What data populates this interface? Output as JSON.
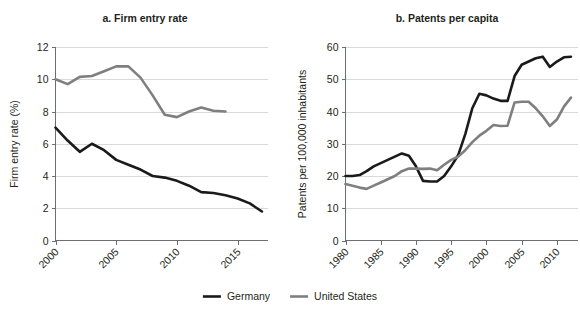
{
  "figure": {
    "width": 580,
    "height": 316,
    "background": "#ffffff"
  },
  "legend": {
    "position": "bottom-center",
    "entries": [
      {
        "label": "Germany",
        "color": "#1a1a1a",
        "width": 2.6
      },
      {
        "label": "United States",
        "color": "#7f7f7f",
        "width": 2.6
      }
    ]
  },
  "chart_data": [
    {
      "type": "line",
      "id": "panel-a",
      "title": "a. Firm entry rate",
      "xlabel": "",
      "ylabel": "Firm entry rate (%)",
      "xlim": [
        2000,
        2017.5
      ],
      "ylim": [
        0,
        12
      ],
      "yticks": [
        0,
        2,
        4,
        6,
        8,
        10,
        12
      ],
      "xticks": [
        2000,
        2005,
        2010,
        2015
      ],
      "grid": "horizontal",
      "legend_position": "figure-bottom",
      "series": [
        {
          "name": "Germany",
          "color": "#1a1a1a",
          "x": [
            2000,
            2001,
            2002,
            2003,
            2004,
            2005,
            2006,
            2007,
            2008,
            2009,
            2010,
            2011,
            2012,
            2013,
            2014,
            2015,
            2016,
            2017
          ],
          "values": [
            7.0,
            6.2,
            5.5,
            6.0,
            5.6,
            5.0,
            4.7,
            4.4,
            4.0,
            3.9,
            3.7,
            3.4,
            3.0,
            2.95,
            2.8,
            2.6,
            2.3,
            1.8
          ]
        },
        {
          "name": "United States",
          "color": "#7f7f7f",
          "x": [
            2000,
            2001,
            2002,
            2003,
            2004,
            2005,
            2006,
            2007,
            2008,
            2009,
            2010,
            2011,
            2012,
            2013,
            2014
          ],
          "values": [
            10.0,
            9.7,
            10.15,
            10.2,
            10.5,
            10.8,
            10.8,
            10.1,
            9.0,
            7.8,
            7.65,
            8.0,
            8.25,
            8.05,
            8.0
          ]
        }
      ]
    },
    {
      "type": "line",
      "id": "panel-b",
      "title": "b. Patents per capita",
      "xlabel": "",
      "ylabel": "Patents per 100,000 inhabitants",
      "xlim": [
        1980,
        2013
      ],
      "ylim": [
        0,
        60
      ],
      "yticks": [
        0,
        10,
        20,
        30,
        40,
        50,
        60
      ],
      "xticks": [
        1980,
        1985,
        1990,
        1995,
        2000,
        2005,
        2010
      ],
      "grid": "horizontal",
      "legend_position": "figure-bottom",
      "series": [
        {
          "name": "Germany",
          "color": "#1a1a1a",
          "x": [
            1980,
            1981,
            1982,
            1983,
            1984,
            1985,
            1986,
            1987,
            1988,
            1989,
            1990,
            1991,
            1992,
            1993,
            1994,
            1995,
            1996,
            1997,
            1998,
            1999,
            2000,
            2001,
            2002,
            2003,
            2004,
            2005,
            2006,
            2007,
            2008,
            2009,
            2010,
            2011,
            2012
          ],
          "values": [
            20.0,
            20.0,
            20.3,
            21.5,
            23.0,
            24.0,
            25.0,
            26.0,
            27.0,
            26.3,
            23.0,
            18.5,
            18.3,
            18.3,
            20.0,
            23.0,
            26.5,
            33.0,
            41.0,
            45.5,
            45.0,
            44.0,
            43.3,
            43.3,
            51.0,
            54.5,
            55.5,
            56.5,
            57.0,
            53.8,
            55.5,
            56.8,
            57.0
          ]
        },
        {
          "name": "United States",
          "color": "#7f7f7f",
          "x": [
            1980,
            1981,
            1982,
            1983,
            1984,
            1985,
            1986,
            1987,
            1988,
            1989,
            1990,
            1991,
            1992,
            1993,
            1994,
            1995,
            1996,
            1997,
            1998,
            1999,
            2000,
            2001,
            2002,
            2003,
            2004,
            2005,
            2006,
            2007,
            2008,
            2009,
            2010,
            2011,
            2012
          ],
          "values": [
            17.5,
            17.0,
            16.4,
            16.0,
            17.0,
            18.0,
            19.0,
            20.0,
            21.5,
            22.3,
            22.3,
            22.2,
            22.3,
            21.8,
            23.5,
            25.0,
            26.0,
            28.0,
            30.5,
            32.5,
            34.0,
            35.8,
            35.5,
            35.6,
            42.8,
            43.0,
            43.0,
            41.0,
            38.5,
            35.5,
            37.5,
            41.5,
            44.3
          ]
        }
      ]
    }
  ],
  "panel_a_axis_texts": {
    "title": "a. Firm entry rate",
    "ylabel": "Firm entry rate (%)",
    "yticks": [
      "0",
      "2",
      "4",
      "6",
      "8",
      "10",
      "12"
    ],
    "xticks": [
      "2000",
      "2005",
      "2010",
      "2015"
    ]
  },
  "panel_b_axis_texts": {
    "title": "b. Patents per capita",
    "ylabel": "Patents per 100,000 inhabitants",
    "yticks": [
      "0",
      "10",
      "20",
      "30",
      "40",
      "50",
      "60"
    ],
    "xticks": [
      "1980",
      "1985",
      "1990",
      "1995",
      "2000",
      "2005",
      "2010"
    ]
  }
}
